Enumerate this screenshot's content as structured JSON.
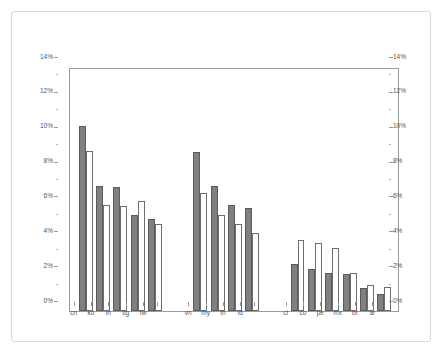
{
  "chart_data": {
    "type": "bar",
    "title": "",
    "subtitle": "",
    "xlabel": "",
    "ylabel": "",
    "ylim": [
      0,
      14
    ],
    "ytick_step": 2,
    "ytick_labels": [
      "0%",
      "2%",
      "4%",
      "6%",
      "8%",
      "10%",
      "12%",
      "14%"
    ],
    "ytick_values": [
      0,
      2,
      4,
      6,
      8,
      10,
      12,
      14
    ],
    "dual_axis": true,
    "grid": false,
    "legend_position": "top-right",
    "categories": [
      "cn",
      "ko",
      "in",
      "sg",
      "tw",
      "vn",
      "my",
      "th",
      "id",
      "cl",
      "co",
      "pe",
      "mx",
      "br",
      "ar"
    ],
    "groups": [
      {
        "name": "group-1",
        "categories": [
          "cn",
          "ko",
          "in",
          "sg",
          "tw"
        ]
      },
      {
        "name": "group-2",
        "categories": [
          "vn",
          "my",
          "th",
          "id"
        ]
      },
      {
        "name": "group-3",
        "categories": [
          "cl",
          "co",
          "pe",
          "mx",
          "br",
          "ar"
        ]
      }
    ],
    "series": [
      {
        "name": "mf",
        "color": "#808080",
        "values": [
          10.6,
          7.2,
          7.1,
          5.5,
          5.3,
          9.1,
          7.2,
          6.1,
          5.9,
          2.7,
          2.4,
          2.2,
          2.1,
          1.3,
          1.0
        ]
      },
      {
        "name": "gdp-mf",
        "color": "#ffffff",
        "values": [
          9.2,
          6.1,
          6.0,
          6.3,
          5.0,
          6.8,
          5.5,
          5.0,
          4.5,
          4.1,
          3.9,
          3.6,
          2.2,
          1.5,
          1.4
        ]
      }
    ]
  },
  "legend": {
    "items": [
      {
        "label": "mf",
        "swatch": "mf"
      },
      {
        "label": "gdp-mf",
        "swatch": "gdpmf"
      }
    ]
  }
}
